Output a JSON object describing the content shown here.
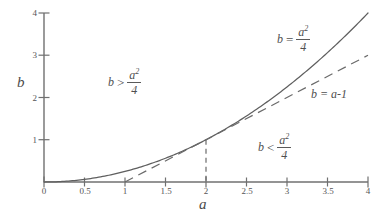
{
  "chart_data": {
    "type": "line",
    "title": "",
    "xlabel": "a",
    "ylabel": "b",
    "xlim": [
      0,
      4
    ],
    "ylim": [
      0,
      4
    ],
    "xticks": [
      "0",
      "0.5",
      "1",
      "1.5",
      "2",
      "2.5",
      "3",
      "3.5",
      "4"
    ],
    "xtick_values": [
      0,
      0.5,
      1,
      1.5,
      2,
      2.5,
      3,
      3.5,
      4
    ],
    "yticks": [
      "1",
      "2",
      "3",
      "4"
    ],
    "ytick_values": [
      1,
      2,
      3,
      4
    ],
    "grid": false,
    "legend_position": "inline-annotations",
    "series": [
      {
        "name": "b = a^2/4",
        "style": "solid",
        "formula": "b = a*a/4",
        "x": [
          0,
          0.25,
          0.5,
          0.75,
          1,
          1.25,
          1.5,
          1.75,
          2,
          2.25,
          2.5,
          2.75,
          3,
          3.25,
          3.5,
          3.75,
          4
        ],
        "values": [
          0,
          0.0156,
          0.0625,
          0.1406,
          0.25,
          0.3906,
          0.5625,
          0.7656,
          1,
          1.2656,
          1.5625,
          1.8906,
          2.25,
          2.6406,
          3.0625,
          3.5156,
          4
        ]
      },
      {
        "name": "b = a-1",
        "style": "dashed",
        "formula": "b = a - 1",
        "x": [
          1,
          4
        ],
        "values": [
          0,
          3
        ]
      }
    ],
    "tangency_point": {
      "a": 2,
      "b": 1
    },
    "dropline": {
      "style": "dashed",
      "from": [
        2,
        1
      ],
      "to": [
        2,
        0
      ]
    }
  },
  "axes": {
    "x_label": "a",
    "y_label": "b"
  },
  "annotations": {
    "region_above": {
      "var": "b",
      "relation": ">",
      "numerator": "a",
      "exponent": "2",
      "denominator": "4"
    },
    "region_below": {
      "var": "b",
      "relation": "<",
      "numerator": "a",
      "exponent": "2",
      "denominator": "4"
    },
    "curve_label": {
      "var": "b",
      "relation": "=",
      "numerator": "a",
      "exponent": "2",
      "denominator": "4"
    },
    "line_label": {
      "text": "b = a-1"
    }
  },
  "colors": {
    "curve": "#5f5f5f",
    "line": "#6a6a6a",
    "axis": "#707070",
    "text": "#4f4f4f",
    "background": "#ffffff"
  }
}
